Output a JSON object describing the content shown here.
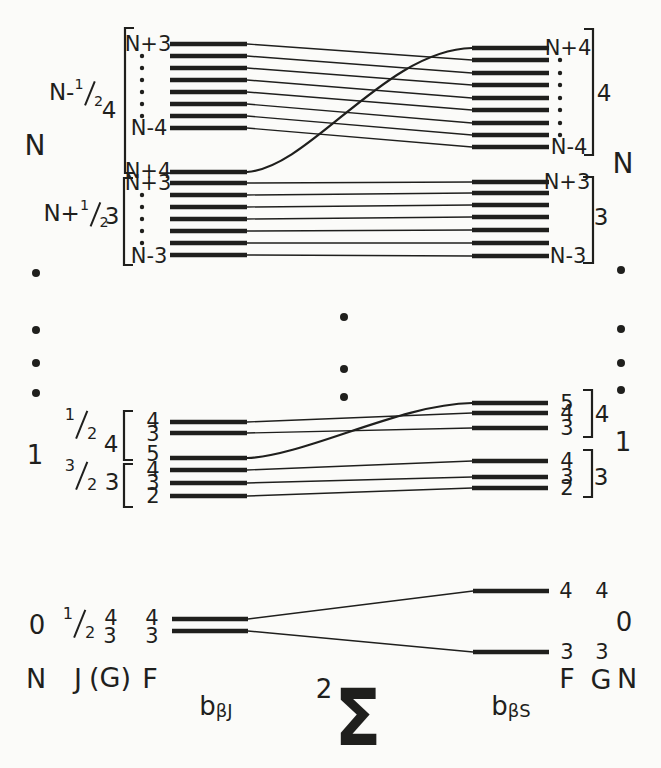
{
  "colors": {
    "ink": "#1f1f1d",
    "paper": "#fbfbf9"
  },
  "side": {
    "n_left": "N",
    "n_right": "N",
    "one_left": "1",
    "one_right": "1",
    "zero_left": "0",
    "zero_right": "0"
  },
  "axis_left": {
    "n": "N",
    "j": "J",
    "g": "(G)",
    "f": "F"
  },
  "axis_right": {
    "f": "F",
    "g": "G",
    "n": "N"
  },
  "basis_left": {
    "base": "b",
    "sub": "βJ"
  },
  "state": {
    "sup": "2",
    "sigma": "Σ"
  },
  "basis_right": {
    "base": "b",
    "sub": "βS"
  },
  "top": {
    "g1": {
      "j_prefix": "N-",
      "j_num": "1",
      "j_den": "2",
      "g": "4",
      "l_top": "N+3",
      "l_bottom": "N-4",
      "l_extra": "N+4",
      "r_top": "N+4",
      "r_bottom": "N-4",
      "r_g": "4"
    },
    "g2": {
      "j_prefix": "N+",
      "j_num": "1",
      "j_den": "2",
      "g": "3",
      "l_top": "N+3",
      "l_bottom": "N-3",
      "r_top": "N+3",
      "r_bottom": "N-3",
      "r_g": "3"
    }
  },
  "mid": {
    "gA": {
      "j_num": "1",
      "j_den": "2",
      "g": "4",
      "l_f": [
        "4",
        "3",
        "5"
      ],
      "r_f": [
        "5",
        "4",
        "3"
      ],
      "r_g": "4"
    },
    "gB": {
      "j_num": "3",
      "j_den": "2",
      "g": "3",
      "l_f": [
        "4",
        "3",
        "2"
      ],
      "r_f": [
        "4",
        "3",
        "2"
      ],
      "r_g": "3"
    }
  },
  "bottom": {
    "j_num": "1",
    "j_den": "2",
    "l_g": [
      "4",
      "3"
    ],
    "l_f": [
      "4",
      "3"
    ],
    "r_f": [
      "4",
      "3"
    ],
    "r_g": [
      "4",
      "3"
    ]
  }
}
